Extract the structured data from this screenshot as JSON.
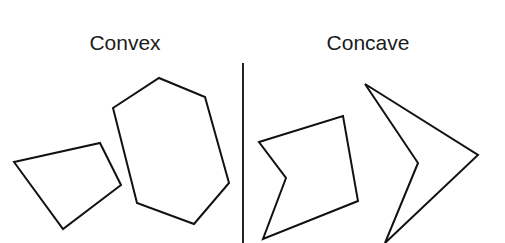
{
  "diagram": {
    "title_left": "Convex",
    "title_right": "Concave",
    "colors": {
      "stroke": "#111111",
      "background": "#ffffff"
    },
    "sections": [
      {
        "name": "convex",
        "label": "Convex",
        "shapes": [
          {
            "type": "quadrilateral",
            "points": [
              [
                14,
                162
              ],
              [
                100,
                143
              ],
              [
                121,
                185
              ],
              [
                63,
                229
              ]
            ]
          },
          {
            "type": "hexagon",
            "points": [
              [
                113,
                108
              ],
              [
                159,
                78
              ],
              [
                205,
                97
              ],
              [
                229,
                183
              ],
              [
                194,
                224
              ],
              [
                137,
                203
              ]
            ]
          }
        ]
      },
      {
        "name": "concave",
        "label": "Concave",
        "shapes": [
          {
            "type": "notched-pentagon",
            "points": [
              [
                259,
                142
              ],
              [
                343,
                116
              ],
              [
                358,
                201
              ],
              [
                263,
                239
              ],
              [
                286,
                178
              ]
            ]
          },
          {
            "type": "chevron",
            "points": [
              [
                365,
                84
              ],
              [
                478,
                155
              ],
              [
                385,
                243
              ],
              [
                418,
                163
              ]
            ]
          }
        ]
      }
    ],
    "divider": {
      "x": 243,
      "y1": 63,
      "y2": 243
    }
  }
}
